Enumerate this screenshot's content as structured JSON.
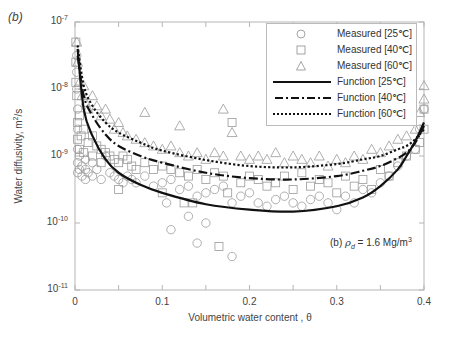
{
  "panel_label": "(b)",
  "axes": {
    "xlabel": "Volumetric water content , θ",
    "ylabel": "Water diffusivity, m",
    "ylabel_sup": "2",
    "ylabel_tail": "/s",
    "y_ticks": [
      {
        "base": "10",
        "exp": "-7"
      },
      {
        "base": "10",
        "exp": "-8"
      },
      {
        "base": "10",
        "exp": "-9"
      },
      {
        "base": "10",
        "exp": "-10"
      },
      {
        "base": "10",
        "exp": "-11"
      }
    ],
    "x_ticks": [
      "0",
      "0.1",
      "0.2",
      "0.3",
      "0.4"
    ]
  },
  "legend": {
    "items": [
      {
        "label": "Measured [25℃]",
        "symbol": "circle"
      },
      {
        "label": "Measured [40℃]",
        "symbol": "square"
      },
      {
        "label": "Measured [60℃]",
        "symbol": "triangle"
      },
      {
        "label": "Function [25℃]",
        "symbol": "solid-line"
      },
      {
        "label": "Function [40℃]",
        "symbol": "dash-dot-line"
      },
      {
        "label": "Function [60℃]",
        "symbol": "dotted-line"
      }
    ]
  },
  "annotation": {
    "prefix": "(b)  ",
    "symbol": "ρ",
    "sub": "d",
    "mid": " = 1.6 Mg/m",
    "sup": "3"
  },
  "colors": {
    "marker": "#9a9a9a",
    "curve": "#111111",
    "axis": "#b5b5b5"
  },
  "chart_data": {
    "type": "scatter",
    "title": "",
    "xlabel": "Volumetric water content , θ",
    "ylabel": "Water diffusivity, m²/s",
    "xlim": [
      0,
      0.4
    ],
    "ylim": [
      1e-11,
      1e-07
    ],
    "yscale": "log",
    "grid": false,
    "legend_position": "upper right",
    "annotation": "(b) ρd = 1.6 Mg/m³",
    "series": [
      {
        "name": "Function [25℃]",
        "kind": "line",
        "style": "solid",
        "x": [
          0.003,
          0.01,
          0.02,
          0.035,
          0.05,
          0.075,
          0.1,
          0.15,
          0.2,
          0.25,
          0.3,
          0.33,
          0.35,
          0.37,
          0.38,
          0.39,
          0.4
        ],
        "log10_y": [
          -7.4,
          -8.3,
          -8.7,
          -9.05,
          -9.25,
          -9.43,
          -9.55,
          -9.72,
          -9.8,
          -9.83,
          -9.75,
          -9.62,
          -9.45,
          -9.2,
          -9.0,
          -8.78,
          -8.5
        ]
      },
      {
        "name": "Function [40℃]",
        "kind": "line",
        "style": "dash-dot",
        "x": [
          0.003,
          0.01,
          0.02,
          0.035,
          0.05,
          0.075,
          0.1,
          0.15,
          0.2,
          0.25,
          0.3,
          0.33,
          0.35,
          0.37,
          0.38,
          0.39,
          0.4
        ],
        "log10_y": [
          -7.5,
          -8.1,
          -8.4,
          -8.68,
          -8.85,
          -9.0,
          -9.1,
          -9.25,
          -9.33,
          -9.35,
          -9.3,
          -9.22,
          -9.15,
          -9.03,
          -8.95,
          -8.8,
          -8.55
        ]
      },
      {
        "name": "Function [60℃]",
        "kind": "line",
        "style": "dotted",
        "x": [
          0.003,
          0.01,
          0.02,
          0.035,
          0.05,
          0.075,
          0.1,
          0.15,
          0.2,
          0.25,
          0.3,
          0.33,
          0.35,
          0.37,
          0.38,
          0.39,
          0.4
        ],
        "log10_y": [
          -7.35,
          -7.95,
          -8.25,
          -8.5,
          -8.65,
          -8.8,
          -8.92,
          -9.06,
          -9.15,
          -9.17,
          -9.12,
          -9.05,
          -9.0,
          -8.9,
          -8.85,
          -8.75,
          -8.6
        ]
      },
      {
        "name": "Measured [25℃]",
        "kind": "scatter",
        "marker": "circle",
        "x": [
          0.002,
          0.002,
          0.002,
          0.003,
          0.003,
          0.003,
          0.003,
          0.003,
          0.005,
          0.005,
          0.008,
          0.008,
          0.012,
          0.012,
          0.012,
          0.015,
          0.02,
          0.02,
          0.025,
          0.03,
          0.035,
          0.04,
          0.045,
          0.05,
          0.055,
          0.06,
          0.065,
          0.07,
          0.08,
          0.09,
          0.1,
          0.105,
          0.11,
          0.12,
          0.13,
          0.14,
          0.15,
          0.16,
          0.17,
          0.18,
          0.19,
          0.2,
          0.21,
          0.22,
          0.23,
          0.24,
          0.25,
          0.26,
          0.27,
          0.28,
          0.29,
          0.3,
          0.31,
          0.32,
          0.33,
          0.34,
          0.35,
          0.36,
          0.37,
          0.38,
          0.39,
          0.395,
          0.4,
          0.11,
          0.13,
          0.14,
          0.15,
          0.18
        ],
        "log10_y": [
          -7.5,
          -7.75,
          -8.0,
          -8.3,
          -8.6,
          -8.9,
          -9.1,
          -9.25,
          -9.0,
          -9.2,
          -9.3,
          -9.15,
          -9.05,
          -9.2,
          -9.35,
          -9.25,
          -9.1,
          -9.3,
          -9.2,
          -9.35,
          -9.0,
          -9.25,
          -9.3,
          -9.35,
          -9.4,
          -9.3,
          -9.35,
          -9.4,
          -9.3,
          -9.45,
          -9.4,
          -9.7,
          -9.35,
          -9.5,
          -9.45,
          -9.6,
          -9.55,
          -9.5,
          -9.45,
          -9.7,
          -9.6,
          -9.55,
          -9.7,
          -9.75,
          -9.65,
          -9.6,
          -9.7,
          -9.75,
          -9.65,
          -9.6,
          -9.7,
          -9.8,
          -9.6,
          -9.7,
          -9.5,
          -9.55,
          -9.4,
          -9.3,
          -9.15,
          -9.0,
          -8.9,
          -8.6,
          -8.3,
          -10.1,
          -9.9,
          -10.3,
          -10.0,
          -10.5
        ]
      },
      {
        "name": "Measured [40℃]",
        "kind": "scatter",
        "marker": "square",
        "x": [
          0.001,
          0.001,
          0.001,
          0.002,
          0.003,
          0.003,
          0.005,
          0.005,
          0.007,
          0.01,
          0.01,
          0.015,
          0.02,
          0.02,
          0.025,
          0.03,
          0.03,
          0.035,
          0.04,
          0.045,
          0.05,
          0.055,
          0.06,
          0.065,
          0.07,
          0.08,
          0.09,
          0.1,
          0.11,
          0.12,
          0.13,
          0.14,
          0.15,
          0.16,
          0.17,
          0.18,
          0.19,
          0.2,
          0.21,
          0.22,
          0.23,
          0.24,
          0.25,
          0.26,
          0.27,
          0.28,
          0.29,
          0.3,
          0.31,
          0.32,
          0.33,
          0.34,
          0.35,
          0.36,
          0.37,
          0.38,
          0.39,
          0.395,
          0.4,
          0.4,
          0.05,
          0.1,
          0.125,
          0.135,
          0.175,
          0.165
        ],
        "log10_y": [
          -7.3,
          -7.6,
          -7.9,
          -8.1,
          -8.5,
          -8.75,
          -8.4,
          -8.9,
          -8.7,
          -8.6,
          -8.95,
          -8.8,
          -8.7,
          -9.0,
          -8.85,
          -8.9,
          -9.1,
          -8.95,
          -9.0,
          -9.05,
          -9.1,
          -9.0,
          -9.05,
          -9.15,
          -9.2,
          -9.1,
          -9.2,
          -9.15,
          -9.2,
          -9.25,
          -9.3,
          -9.2,
          -9.35,
          -9.25,
          -9.3,
          -8.5,
          -9.4,
          -9.3,
          -9.35,
          -9.45,
          -9.4,
          -9.3,
          -9.5,
          -9.25,
          -9.45,
          -9.35,
          -9.4,
          -9.55,
          -9.3,
          -9.45,
          -9.35,
          -9.5,
          -9.2,
          -9.3,
          -9.1,
          -9.0,
          -8.9,
          -8.8,
          -8.6,
          -8.3,
          -9.5,
          -9.55,
          -9.7,
          -9.7,
          -9.55,
          -10.35
        ]
      },
      {
        "name": "Measured [60℃]",
        "kind": "scatter",
        "marker": "triangle",
        "x": [
          0.002,
          0.003,
          0.005,
          0.008,
          0.01,
          0.012,
          0.015,
          0.02,
          0.025,
          0.03,
          0.035,
          0.04,
          0.045,
          0.05,
          0.055,
          0.06,
          0.07,
          0.08,
          0.09,
          0.1,
          0.11,
          0.12,
          0.13,
          0.14,
          0.15,
          0.16,
          0.17,
          0.18,
          0.19,
          0.2,
          0.21,
          0.22,
          0.23,
          0.24,
          0.25,
          0.26,
          0.27,
          0.28,
          0.29,
          0.3,
          0.31,
          0.32,
          0.33,
          0.34,
          0.35,
          0.36,
          0.37,
          0.38,
          0.39,
          0.395,
          0.4,
          0.4,
          0.08,
          0.12,
          0.17
        ],
        "log10_y": [
          -7.3,
          -7.6,
          -7.9,
          -8.1,
          -7.95,
          -8.2,
          -8.3,
          -8.1,
          -8.25,
          -8.4,
          -8.3,
          -8.45,
          -8.6,
          -8.5,
          -8.65,
          -8.7,
          -8.75,
          -8.8,
          -8.85,
          -8.9,
          -8.85,
          -8.95,
          -9.0,
          -8.95,
          -9.05,
          -8.95,
          -9.0,
          -8.65,
          -9.0,
          -9.05,
          -9.0,
          -9.05,
          -8.95,
          -9.1,
          -9.0,
          -9.05,
          -9.1,
          -9.0,
          -9.15,
          -9.05,
          -9.1,
          -9.0,
          -9.05,
          -8.9,
          -8.95,
          -8.85,
          -8.75,
          -8.7,
          -8.6,
          -8.35,
          -8.15,
          -7.95,
          -8.35,
          -8.55,
          -8.3
        ]
      }
    ]
  }
}
